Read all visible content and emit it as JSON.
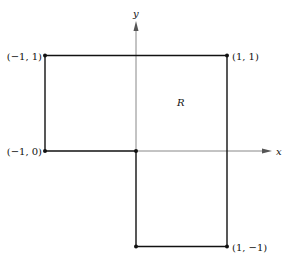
{
  "diagram": {
    "type": "region",
    "axes": {
      "x_label": "x",
      "y_label": "y"
    },
    "region_label": "R",
    "vertices": [
      {
        "name": "top-left",
        "label": "(−1, 1)",
        "x": -1,
        "y": 1
      },
      {
        "name": "top-right",
        "label": "(1, 1)",
        "x": 1,
        "y": 1
      },
      {
        "name": "bottom-right",
        "label": "(1, −1)",
        "x": 1,
        "y": -1
      },
      {
        "name": "bottom-middle",
        "label": "",
        "x": 0,
        "y": -1
      },
      {
        "name": "origin",
        "label": "",
        "x": 0,
        "y": 0
      },
      {
        "name": "left-middle",
        "label": "(−1, 0)",
        "x": -1,
        "y": 0
      }
    ],
    "colors": {
      "line": "#111111",
      "axis": "#888888"
    }
  }
}
